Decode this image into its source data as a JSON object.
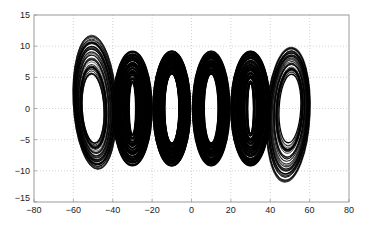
{
  "chart_data": {
    "type": "line",
    "title": "",
    "xlabel": "",
    "ylabel": "",
    "xlim": [
      -80,
      80
    ],
    "ylim": [
      -15,
      15
    ],
    "xticks": [
      -80,
      -60,
      -40,
      -20,
      0,
      20,
      40,
      60,
      80
    ],
    "yticks": [
      -15,
      -10,
      -5,
      0,
      5,
      10,
      15
    ],
    "xtick_labels": [
      "−80",
      "−60",
      "−40",
      "−20",
      "0",
      "20",
      "40",
      "60",
      "80"
    ],
    "ytick_labels": [
      "−15",
      "−10",
      "−5",
      "0",
      "5",
      "10",
      "15"
    ],
    "grid": true,
    "grid_style": "dotted",
    "legend": null,
    "line_color": "#000000",
    "scrolls": [
      {
        "center_x": -50,
        "center_y": 1,
        "outer_rx": 11,
        "outer_ry": 10.8,
        "inner_rx": 5.5,
        "inner_ry": 5.5,
        "tilt": 1.5,
        "density": "sparse"
      },
      {
        "center_x": -30,
        "center_y": 0,
        "outer_rx": 10,
        "outer_ry": 9.2,
        "inner_rx": 1.5,
        "inner_ry": 4,
        "tilt": 0,
        "density": "dense"
      },
      {
        "center_x": -10,
        "center_y": 0,
        "outer_rx": 9.5,
        "outer_ry": 9.2,
        "inner_rx": 3.5,
        "inner_ry": 5.5,
        "tilt": 0,
        "density": "dense"
      },
      {
        "center_x": 10,
        "center_y": 0,
        "outer_rx": 9.5,
        "outer_ry": 9.2,
        "inner_rx": 3.5,
        "inner_ry": 5.5,
        "tilt": 0,
        "density": "dense"
      },
      {
        "center_x": 30,
        "center_y": 0,
        "outer_rx": 10,
        "outer_ry": 9.2,
        "inner_rx": 1.5,
        "inner_ry": 4,
        "tilt": 0,
        "density": "dense"
      },
      {
        "center_x": 50,
        "center_y": -1,
        "outer_rx": 11,
        "outer_ry": 10.8,
        "inner_rx": 5.5,
        "inner_ry": 5.5,
        "tilt": -1.5,
        "density": "sparse"
      }
    ],
    "approx_extent": {
      "x": [
        -61,
        61
      ],
      "y": [
        -12,
        12
      ]
    }
  },
  "plot_box": {
    "left": 34,
    "right": 349,
    "top": 15,
    "bottom": 202
  },
  "colors": {
    "axis": "#9a9a9a",
    "grid": "#c8c8c8",
    "trace": "#000000",
    "background": "#ffffff"
  }
}
